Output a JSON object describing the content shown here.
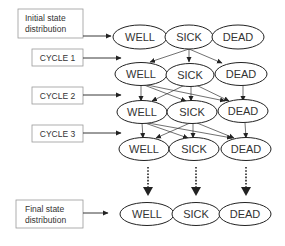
{
  "diagram": {
    "type": "markov-state-transition",
    "states": [
      "WELL",
      "SICK",
      "DEAD"
    ],
    "labels": {
      "initial_line1": "Initial state",
      "initial_line2": "distribution",
      "cycle1": "CYCLE 1",
      "cycle2": "CYCLE 2",
      "cycle3": "CYCLE 3",
      "final_line1": "Final state",
      "final_line2": "distribution"
    },
    "rows": [
      {
        "name": "initial",
        "states": [
          "WELL",
          "SICK",
          "DEAD"
        ]
      },
      {
        "name": "cycle-1",
        "states": [
          "WELL",
          "SICK",
          "DEAD"
        ]
      },
      {
        "name": "cycle-2",
        "states": [
          "WELL",
          "SICK",
          "DEAD"
        ]
      },
      {
        "name": "cycle-3",
        "states": [
          "WELL",
          "SICK",
          "DEAD"
        ]
      },
      {
        "name": "final",
        "states": [
          "WELL",
          "SICK",
          "DEAD"
        ]
      }
    ],
    "colors": {
      "stroke": "#222222",
      "box_border": "#999999",
      "text": "#333333"
    }
  }
}
